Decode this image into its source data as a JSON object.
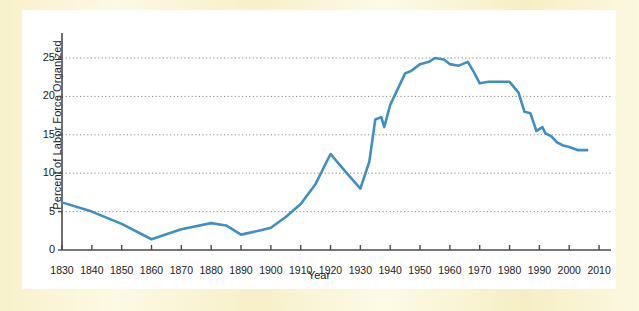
{
  "figure": {
    "background_color": "#fbf6d9",
    "plot_background_color": "#ffffff",
    "line_color": "#3d8fc4",
    "axis_color": "#4a4a4a",
    "grid_color": "#8a8a8a"
  },
  "chart_data": {
    "type": "line",
    "title": "",
    "xlabel": "Year",
    "ylabel": "Percent of Labor Force Organized",
    "xlim": [
      1830,
      2014
    ],
    "ylim": [
      0,
      27
    ],
    "grid": true,
    "legend": "none",
    "xticks": [
      1830,
      1840,
      1850,
      1860,
      1870,
      1880,
      1890,
      1900,
      1910,
      1920,
      1930,
      1940,
      1950,
      1960,
      1970,
      1980,
      1990,
      2000,
      2010
    ],
    "xtick_labels": [
      "1830",
      "1840",
      "1850",
      "1860",
      "1870",
      "1880",
      "1890",
      "1900",
      "1910",
      "1920",
      "1930",
      "1940",
      "1950",
      "1960",
      "1970",
      "1980",
      "1990",
      "2000",
      "2010"
    ],
    "yticks": [
      0,
      5,
      10,
      15,
      20,
      25
    ],
    "ytick_labels": [
      "0",
      "5",
      "10",
      "15",
      "20",
      "25"
    ],
    "gridlines_y": [
      5,
      10,
      15,
      20,
      25
    ],
    "series": [
      {
        "name": "Percent of Labor Force Organized",
        "color": "#3d8fc4",
        "x": [
          1830,
          1840,
          1850,
          1860,
          1870,
          1880,
          1885,
          1890,
          1897,
          1900,
          1905,
          1910,
          1915,
          1920,
          1925,
          1930,
          1933,
          1935,
          1937,
          1938,
          1940,
          1945,
          1947,
          1950,
          1953,
          1955,
          1958,
          1960,
          1963,
          1966,
          1968,
          1970,
          1973,
          1975,
          1978,
          1980,
          1983,
          1985,
          1987,
          1989,
          1991,
          1992,
          1994,
          1996,
          1998,
          2000,
          2003,
          2006
        ],
        "y": [
          6.2,
          5.0,
          3.4,
          1.4,
          2.7,
          3.5,
          3.2,
          2.0,
          2.6,
          2.9,
          4.3,
          6.0,
          8.6,
          12.5,
          10.2,
          8.0,
          11.5,
          17.0,
          17.3,
          16.0,
          18.9,
          23.0,
          23.3,
          24.2,
          24.5,
          25.0,
          24.8,
          24.2,
          24.0,
          24.5,
          23.2,
          21.7,
          21.9,
          21.9,
          21.9,
          21.9,
          20.5,
          18.0,
          17.8,
          15.5,
          16.0,
          15.2,
          14.8,
          14.0,
          13.6,
          13.4,
          13.0,
          13.0
        ]
      }
    ],
    "annotations": []
  },
  "axis": {
    "x_axis_name": "year-axis",
    "y_axis_name": "percent-axis"
  }
}
